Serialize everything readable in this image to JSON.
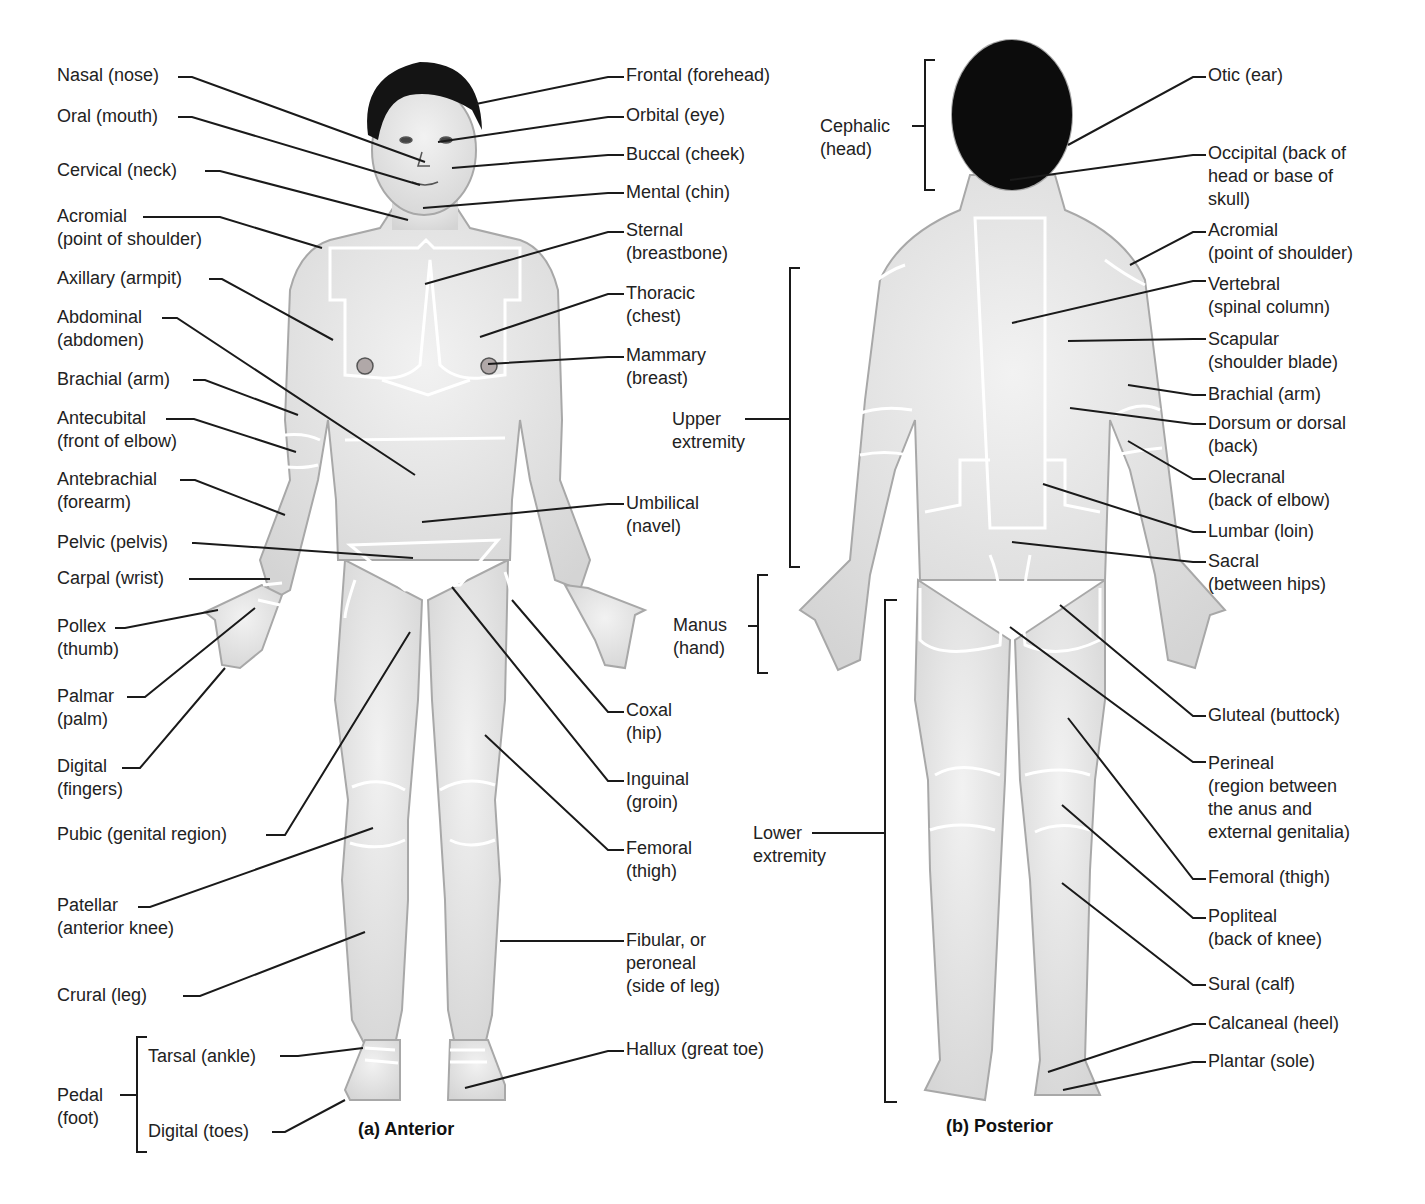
{
  "figure": {
    "anterior_caption": "(a)  Anterior",
    "posterior_caption": "(b)  Posterior",
    "colors": {
      "skin": "#e6e6e6",
      "skin_shadow": "#bdbdbd",
      "hair": "#111111",
      "region_line": "#ffffff",
      "leader_line": "#1a1a1a",
      "text": "#222222"
    }
  },
  "anterior": {
    "left_labels": [
      {
        "id": "nasal",
        "text": [
          "Nasal (nose)"
        ],
        "x": 57,
        "y": 64
      },
      {
        "id": "oral",
        "text": [
          "Oral (mouth)"
        ],
        "x": 57,
        "y": 105
      },
      {
        "id": "cervical",
        "text": [
          "Cervical (neck)"
        ],
        "x": 57,
        "y": 159
      },
      {
        "id": "acromial",
        "text": [
          "Acromial",
          "(point of shoulder)"
        ],
        "x": 57,
        "y": 205
      },
      {
        "id": "axillary",
        "text": [
          "Axillary (armpit)"
        ],
        "x": 57,
        "y": 267
      },
      {
        "id": "abdominal",
        "text": [
          "Abdominal",
          "(abdomen)"
        ],
        "x": 57,
        "y": 306
      },
      {
        "id": "brachial",
        "text": [
          "Brachial (arm)"
        ],
        "x": 57,
        "y": 368
      },
      {
        "id": "antecubital",
        "text": [
          "Antecubital",
          "(front of elbow)"
        ],
        "x": 57,
        "y": 407
      },
      {
        "id": "antebrachial",
        "text": [
          "Antebrachial",
          "(forearm)"
        ],
        "x": 57,
        "y": 468
      },
      {
        "id": "pelvic",
        "text": [
          "Pelvic (pelvis)"
        ],
        "x": 57,
        "y": 531
      },
      {
        "id": "carpal",
        "text": [
          "Carpal (wrist)"
        ],
        "x": 57,
        "y": 567
      },
      {
        "id": "pollex",
        "text": [
          "Pollex",
          "(thumb)"
        ],
        "x": 57,
        "y": 615
      },
      {
        "id": "palmar",
        "text": [
          "Palmar",
          "(palm)"
        ],
        "x": 57,
        "y": 685
      },
      {
        "id": "digital-fingers",
        "text": [
          "Digital",
          "(fingers)"
        ],
        "x": 57,
        "y": 755
      },
      {
        "id": "pubic",
        "text": [
          "Pubic (genital region)"
        ],
        "x": 57,
        "y": 823
      },
      {
        "id": "patellar",
        "text": [
          "Patellar",
          "(anterior knee)"
        ],
        "x": 57,
        "y": 894
      },
      {
        "id": "crural",
        "text": [
          "Crural (leg)"
        ],
        "x": 57,
        "y": 984
      }
    ],
    "pedal_group": {
      "label": [
        "Pedal",
        "(foot)"
      ],
      "items": [
        {
          "id": "tarsal",
          "text": [
            "Tarsal (ankle)"
          ]
        },
        {
          "id": "digital-toes",
          "text": [
            "Digital (toes)"
          ]
        }
      ]
    },
    "right_labels": [
      {
        "id": "frontal",
        "text": [
          "Frontal (forehead)"
        ],
        "x": 626,
        "y": 64
      },
      {
        "id": "orbital",
        "text": [
          "Orbital (eye)"
        ],
        "x": 626,
        "y": 104
      },
      {
        "id": "buccal",
        "text": [
          "Buccal (cheek)"
        ],
        "x": 626,
        "y": 143
      },
      {
        "id": "mental",
        "text": [
          "Mental (chin)"
        ],
        "x": 626,
        "y": 181
      },
      {
        "id": "sternal",
        "text": [
          "Sternal",
          "(breastbone)"
        ],
        "x": 626,
        "y": 219
      },
      {
        "id": "thoracic",
        "text": [
          "Thoracic",
          "(chest)"
        ],
        "x": 626,
        "y": 282
      },
      {
        "id": "mammary",
        "text": [
          "Mammary",
          "(breast)"
        ],
        "x": 626,
        "y": 344
      },
      {
        "id": "umbilical",
        "text": [
          "Umbilical",
          "(navel)"
        ],
        "x": 626,
        "y": 492
      },
      {
        "id": "coxal",
        "text": [
          "Coxal",
          "(hip)"
        ],
        "x": 626,
        "y": 699
      },
      {
        "id": "inguinal",
        "text": [
          "Inguinal",
          "(groin)"
        ],
        "x": 626,
        "y": 768
      },
      {
        "id": "femoral",
        "text": [
          "Femoral",
          "(thigh)"
        ],
        "x": 626,
        "y": 837
      },
      {
        "id": "fibular",
        "text": [
          "Fibular, or",
          "peroneal",
          "(side of leg)"
        ],
        "x": 626,
        "y": 929
      },
      {
        "id": "hallux",
        "text": [
          "Hallux (great toe)"
        ],
        "x": 626,
        "y": 1038
      }
    ]
  },
  "posterior": {
    "bracket_labels": [
      {
        "id": "cephalic",
        "text": [
          "Cephalic",
          "(head)"
        ],
        "x": 820,
        "y": 115
      },
      {
        "id": "upper-extremity",
        "text": [
          "Upper",
          "extremity"
        ],
        "x": 672,
        "y": 408
      },
      {
        "id": "manus",
        "text": [
          "Manus",
          "(hand)"
        ],
        "x": 673,
        "y": 614
      },
      {
        "id": "lower-extremity",
        "text": [
          "Lower",
          "extremity"
        ],
        "x": 753,
        "y": 822
      }
    ],
    "right_labels": [
      {
        "id": "otic",
        "text": [
          "Otic (ear)"
        ],
        "x": 1208,
        "y": 64
      },
      {
        "id": "occipital",
        "text": [
          "Occipital (back of",
          "head or base of",
          "skull)"
        ],
        "x": 1208,
        "y": 142
      },
      {
        "id": "acromial-p",
        "text": [
          "Acromial",
          "(point of shoulder)"
        ],
        "x": 1208,
        "y": 219
      },
      {
        "id": "vertebral",
        "text": [
          "Vertebral",
          "(spinal column)"
        ],
        "x": 1208,
        "y": 273
      },
      {
        "id": "scapular",
        "text": [
          "Scapular",
          "(shoulder blade)"
        ],
        "x": 1208,
        "y": 328
      },
      {
        "id": "brachial-p",
        "text": [
          "Brachial (arm)"
        ],
        "x": 1208,
        "y": 383
      },
      {
        "id": "dorsum",
        "text": [
          "Dorsum or dorsal",
          "(back)"
        ],
        "x": 1208,
        "y": 412
      },
      {
        "id": "olecranal",
        "text": [
          "Olecranal",
          "(back of elbow)"
        ],
        "x": 1208,
        "y": 466
      },
      {
        "id": "lumbar",
        "text": [
          "Lumbar (loin)"
        ],
        "x": 1208,
        "y": 520
      },
      {
        "id": "sacral",
        "text": [
          "Sacral",
          "(between hips)"
        ],
        "x": 1208,
        "y": 550
      },
      {
        "id": "gluteal",
        "text": [
          "Gluteal (buttock)"
        ],
        "x": 1208,
        "y": 704
      },
      {
        "id": "perineal",
        "text": [
          "Perineal",
          "(region between",
          "the anus and",
          "external genitalia)"
        ],
        "x": 1208,
        "y": 752
      },
      {
        "id": "femoral-p",
        "text": [
          "Femoral (thigh)"
        ],
        "x": 1208,
        "y": 866
      },
      {
        "id": "popliteal",
        "text": [
          "Popliteal",
          "(back of knee)"
        ],
        "x": 1208,
        "y": 905
      },
      {
        "id": "sural",
        "text": [
          "Sural (calf)"
        ],
        "x": 1208,
        "y": 973
      },
      {
        "id": "calcaneal",
        "text": [
          "Calcaneal (heel)"
        ],
        "x": 1208,
        "y": 1012
      },
      {
        "id": "plantar",
        "text": [
          "Plantar (sole)"
        ],
        "x": 1208,
        "y": 1050
      }
    ]
  }
}
